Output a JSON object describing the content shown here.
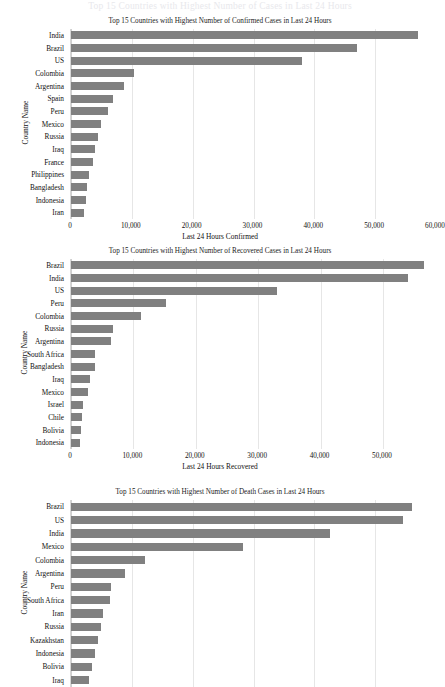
{
  "ghost_header_text": "Top 15 Countries with Highest Number of Cases in Last 24 Hours",
  "axis": {
    "ylabel": "Country Name"
  },
  "chart_data": [
    {
      "id": "confirmed",
      "type": "bar",
      "orientation": "horizontal",
      "title": "Top 15 Countries with Highest Number of Confirmed Cases in Last 24 Hours",
      "xlabel": "Last 24 Hours Confirmed",
      "ylabel": "Country Name",
      "grid": true,
      "legend": "none",
      "xlim": [
        0,
        60000
      ],
      "xticks": [
        0,
        10000,
        20000,
        30000,
        40000,
        50000,
        60000
      ],
      "xticklabels": [
        "0",
        "10,000",
        "20,000",
        "30,000",
        "40,000",
        "50,000",
        "60,000"
      ],
      "categories": [
        "India",
        "Brazil",
        "US",
        "Colombia",
        "Argentina",
        "Spain",
        "Peru",
        "Mexico",
        "Russia",
        "Iraq",
        "France",
        "Philippines",
        "Bangladesh",
        "Indonesia",
        "Iran"
      ],
      "values": [
        57000,
        47000,
        38000,
        10400,
        8700,
        6900,
        6000,
        4900,
        4500,
        4000,
        3600,
        2900,
        2600,
        2400,
        2200
      ]
    },
    {
      "id": "recovered",
      "type": "bar",
      "orientation": "horizontal",
      "title": "Top 15 Countries with Highest Number of Recovered Cases in Last 24 Hours",
      "xlabel": "Last 24 Hours Recovered",
      "ylabel": "Country Name",
      "grid": true,
      "legend": "none",
      "xlim": [
        0,
        58500
      ],
      "xticks": [
        0,
        10000,
        20000,
        30000,
        40000,
        50000
      ],
      "xticklabels": [
        "0",
        "10,000",
        "20,000",
        "30,000",
        "40,000",
        "50,000"
      ],
      "categories": [
        "Brazil",
        "India",
        "US",
        "Peru",
        "Colombia",
        "Russia",
        "Argentina",
        "South Africa",
        "Bangladesh",
        "Iraq",
        "Mexico",
        "Israel",
        "Chile",
        "Bolivia",
        "Indonesia"
      ],
      "values": [
        56500,
        54000,
        33000,
        15300,
        11200,
        6700,
        6400,
        3800,
        3800,
        3100,
        2800,
        1900,
        1700,
        1600,
        1400
      ]
    },
    {
      "id": "deaths",
      "type": "bar",
      "orientation": "horizontal",
      "title": "Top 15 Countries with Highest Number of Death Cases in Last 24 Hours",
      "xlabel": "",
      "ylabel": "Country Name",
      "grid": true,
      "legend": "none",
      "xlim": [
        0,
        60000
      ],
      "xticks": [],
      "xticklabels": [],
      "categories": [
        "Brazil",
        "US",
        "India",
        "Mexico",
        "Colombia",
        "Argentina",
        "Peru",
        "South Africa",
        "Iran",
        "Russia",
        "Kazakhstan",
        "Indonesia",
        "Bolivia",
        "Iraq"
      ],
      "values": [
        56000,
        54500,
        42500,
        28300,
        12200,
        8800,
        6500,
        6400,
        5200,
        5000,
        4400,
        4000,
        3400,
        3000
      ]
    }
  ]
}
